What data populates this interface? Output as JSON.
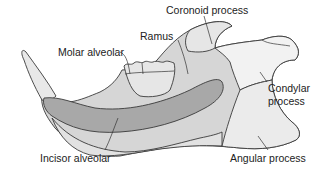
{
  "diagram": {
    "labels": {
      "coronoid": "Coronoid process",
      "ramus": "Ramus",
      "molar_alveolar": "Molar alveolar",
      "condylar_line1": "Condylar",
      "condylar_line2": "process",
      "incisor_alveolar": "Incisor alveolar",
      "angular": "Angular process"
    },
    "colors": {
      "bone_light": "#e6e6e6",
      "bone_mid": "#d4d4d4",
      "incisor_alveolar_fill": "#a9a9a9",
      "outline": "#3a3a3a",
      "background": "#ffffff"
    }
  }
}
